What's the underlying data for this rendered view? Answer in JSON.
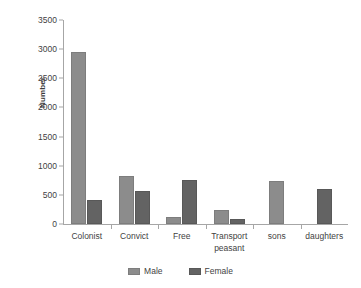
{
  "chart_data": {
    "type": "bar",
    "title": "",
    "xlabel": "",
    "ylabel": "Number",
    "ylim": [
      0,
      3500
    ],
    "ytick_step": 500,
    "yticks": [
      "0",
      "500",
      "1000",
      "1500",
      "2000",
      "2500",
      "3000",
      "3500"
    ],
    "grid": false,
    "legend_position": "bottom",
    "categories": [
      "Colonist",
      "Convict",
      "Free",
      "Transport peasant",
      "sons",
      "daughters"
    ],
    "series": [
      {
        "name": "Male",
        "color": "#8c8c8c",
        "values": [
          2950,
          820,
          120,
          240,
          730,
          null
        ]
      },
      {
        "name": "Female",
        "color": "#636363",
        "values": [
          410,
          560,
          760,
          90,
          null,
          600
        ]
      }
    ]
  },
  "axis": {
    "y_title": "Number"
  },
  "legend": {
    "items": [
      {
        "label": "Male",
        "swatch": "male-swatch"
      },
      {
        "label": "Female",
        "swatch": "female-swatch"
      }
    ]
  }
}
